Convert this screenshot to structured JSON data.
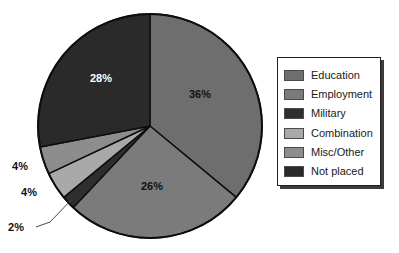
{
  "chart_data": {
    "type": "pie",
    "title": "",
    "subtitle": "",
    "xlabel": "",
    "ylabel": "",
    "legend_position": "right",
    "grid": false,
    "categories": [
      "Education",
      "Employment",
      "Military",
      "Combination",
      "Misc/Other",
      "Not placed"
    ],
    "values": [
      36,
      26,
      2,
      4,
      4,
      28
    ],
    "value_unit": "%",
    "data_labels": [
      "36%",
      "26%",
      "2%",
      "4%",
      "4%",
      "28%"
    ],
    "colors": [
      "#6e6e6e",
      "#7b7b7b",
      "#2e2e2e",
      "#a9a9a9",
      "#8d8d8d",
      "#2a2a2a"
    ],
    "start_angle_deg": 0,
    "direction": "clockwise",
    "slices": [
      {
        "name": "Education",
        "value": 36,
        "label": "36%",
        "color": "#6e6e6e",
        "label_color": "#111111",
        "label_x": 200,
        "label_y": 98,
        "label_placement": "inside"
      },
      {
        "name": "Employment",
        "value": 26,
        "label": "26%",
        "color": "#7b7b7b",
        "label_color": "#111111",
        "label_x": 152,
        "label_y": 190,
        "label_placement": "inside"
      },
      {
        "name": "Military",
        "value": 2,
        "label": "2%",
        "color": "#2e2e2e",
        "label_color": "#111111",
        "label_x": 16,
        "label_y": 231,
        "label_placement": "outside-leader"
      },
      {
        "name": "Combination",
        "value": 4,
        "label": "4%",
        "color": "#a9a9a9",
        "label_color": "#111111",
        "label_x": 29,
        "label_y": 196,
        "label_placement": "outside"
      },
      {
        "name": "Misc/Other",
        "value": 4,
        "label": "4%",
        "color": "#8d8d8d",
        "label_color": "#111111",
        "label_x": 20,
        "label_y": 170,
        "label_placement": "outside"
      },
      {
        "name": "Not placed",
        "value": 28,
        "label": "28%",
        "color": "#2a2a2a",
        "label_color": "#ffffff",
        "label_x": 101,
        "label_y": 82,
        "label_placement": "inside"
      }
    ]
  },
  "legend": {
    "items": [
      {
        "label": "Education",
        "color": "#6e6e6e"
      },
      {
        "label": "Employment",
        "color": "#7b7b7b"
      },
      {
        "label": "Military",
        "color": "#2e2e2e"
      },
      {
        "label": "Combination",
        "color": "#a9a9a9"
      },
      {
        "label": "Misc/Other",
        "color": "#8d8d8d"
      },
      {
        "label": "Not placed",
        "color": "#2a2a2a"
      }
    ]
  },
  "geometry": {
    "center_x": 150,
    "center_y": 126,
    "radius": 112,
    "outline_color": "#0d0d0d",
    "outline_width": 2
  }
}
